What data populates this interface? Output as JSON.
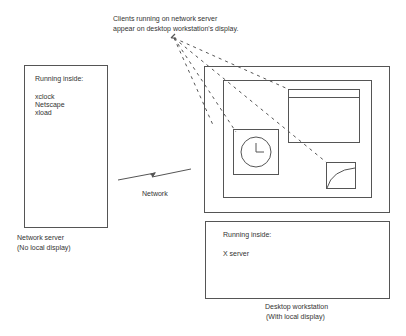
{
  "caption": {
    "line1": "Clients running on network server",
    "line2": "appear on desktop workstation's display."
  },
  "network_server": {
    "heading": "Running inside:",
    "processes": [
      "xclock",
      "Netscape",
      "xload"
    ],
    "label_line1": "Network server",
    "label_line2": "(No local display)"
  },
  "network_link": {
    "label": "Network",
    "icon": "lightning-bolt-icon"
  },
  "desktop_workstation": {
    "display": {
      "windows": [
        {
          "name": "Netscape",
          "icon": "browser-window-icon"
        },
        {
          "name": "xclock",
          "icon": "clock-icon"
        },
        {
          "name": "xload",
          "icon": "load-graph-icon"
        }
      ]
    },
    "heading": "Running inside:",
    "processes": [
      "X server"
    ],
    "label_line1": "Desktop workstation",
    "label_line2": "(With local display)"
  },
  "colors": {
    "line": "#555555",
    "text": "#333333",
    "background": "#ffffff"
  }
}
